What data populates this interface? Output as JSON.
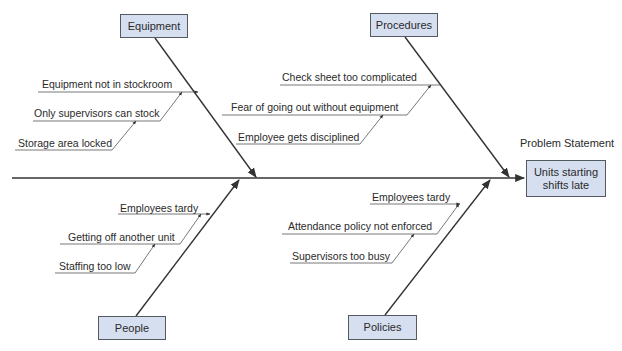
{
  "diagram": {
    "type": "fishbone",
    "problem_label": "Problem Statement",
    "problem": "Units starting shifts late",
    "problem_lines": [
      "Units starting",
      "shifts late"
    ],
    "categories": [
      {
        "name": "Equipment",
        "position": "top-left",
        "causes": [
          "Equipment not in stockroom",
          "Only supervisors can stock",
          "Storage area locked"
        ]
      },
      {
        "name": "Procedures",
        "position": "top-right",
        "causes": [
          "Check sheet too complicated",
          "Fear of going out without equipment",
          "Employee gets disciplined"
        ]
      },
      {
        "name": "People",
        "position": "bottom-left",
        "causes": [
          "Employees tardy",
          "Getting off another unit",
          "Staffing too low"
        ]
      },
      {
        "name": "Policies",
        "position": "bottom-right",
        "causes": [
          "Employees tardy",
          "Attendance policy not enforced",
          "Supervisors too busy"
        ]
      }
    ]
  },
  "colors": {
    "box_fill": "#d6dff0",
    "box_border": "#555a62",
    "line": "#333333"
  }
}
